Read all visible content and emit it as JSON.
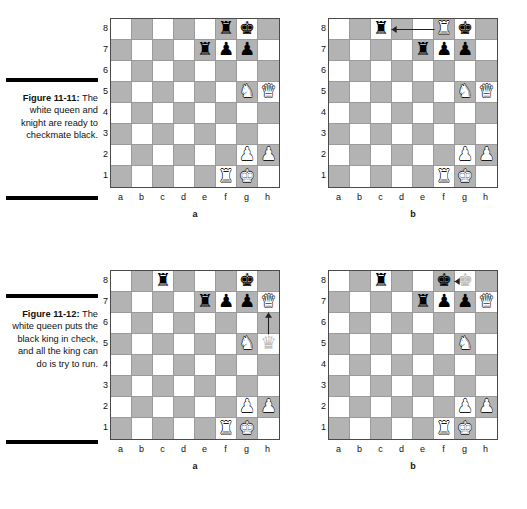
{
  "page": {
    "width": 527,
    "height": 509,
    "light_square_color": "#ffffff",
    "dark_square_color": "#b3b3b3",
    "ghost_piece_color": "#bdbdbd"
  },
  "figures": [
    {
      "id": "figure-11-11",
      "label": "Figure 11-11:",
      "caption": "The white queen and knight are ready to checkmate black.",
      "boards": [
        {
          "letter": "a",
          "rank_labels": [
            "8",
            "7",
            "6",
            "5",
            "4",
            "3",
            "2",
            "1"
          ],
          "file_labels": [
            "a",
            "b",
            "c",
            "d",
            "e",
            "f",
            "g",
            "h"
          ],
          "pieces": [
            {
              "square": "f8",
              "piece": "black-rook",
              "glyph": "♜",
              "color": "black"
            },
            {
              "square": "g8",
              "piece": "black-king",
              "glyph": "♚",
              "color": "black"
            },
            {
              "square": "e7",
              "piece": "black-rook",
              "glyph": "♜",
              "color": "black"
            },
            {
              "square": "f7",
              "piece": "black-pawn",
              "glyph": "♟",
              "color": "black"
            },
            {
              "square": "g7",
              "piece": "black-pawn",
              "glyph": "♟",
              "color": "black"
            },
            {
              "square": "g5",
              "piece": "white-knight",
              "glyph": "♞",
              "color": "white"
            },
            {
              "square": "h5",
              "piece": "white-queen",
              "glyph": "♛",
              "color": "white"
            },
            {
              "square": "g2",
              "piece": "white-pawn",
              "glyph": "♟",
              "color": "white"
            },
            {
              "square": "h2",
              "piece": "white-pawn",
              "glyph": "♟",
              "color": "white"
            },
            {
              "square": "f1",
              "piece": "white-rook",
              "glyph": "♜",
              "color": "white"
            },
            {
              "square": "g1",
              "piece": "white-king",
              "glyph": "♚",
              "color": "white"
            }
          ],
          "arrows": []
        },
        {
          "letter": "b",
          "rank_labels": [
            "8",
            "7",
            "6",
            "5",
            "4",
            "3",
            "2",
            "1"
          ],
          "file_labels": [
            "a",
            "b",
            "c",
            "d",
            "e",
            "f",
            "g",
            "h"
          ],
          "pieces": [
            {
              "square": "c8",
              "piece": "black-rook",
              "glyph": "♜",
              "color": "black"
            },
            {
              "square": "f8",
              "piece": "white-rook",
              "glyph": "♜",
              "color": "white"
            },
            {
              "square": "g8",
              "piece": "black-king",
              "glyph": "♚",
              "color": "black"
            },
            {
              "square": "e7",
              "piece": "black-rook",
              "glyph": "♜",
              "color": "black"
            },
            {
              "square": "f7",
              "piece": "black-pawn",
              "glyph": "♟",
              "color": "black"
            },
            {
              "square": "g7",
              "piece": "black-pawn",
              "glyph": "♟",
              "color": "black"
            },
            {
              "square": "g5",
              "piece": "white-knight",
              "glyph": "♞",
              "color": "white"
            },
            {
              "square": "h5",
              "piece": "white-queen",
              "glyph": "♛",
              "color": "white"
            },
            {
              "square": "g2",
              "piece": "white-pawn",
              "glyph": "♟",
              "color": "white"
            },
            {
              "square": "h2",
              "piece": "white-pawn",
              "glyph": "♟",
              "color": "white"
            },
            {
              "square": "f1",
              "piece": "white-rook",
              "glyph": "♜",
              "color": "white"
            },
            {
              "square": "g1",
              "piece": "white-king",
              "glyph": "♚",
              "color": "white"
            }
          ],
          "arrows": [
            {
              "from": "f8",
              "to": "c8",
              "direction": "left",
              "label": "rook-capture-arrow"
            }
          ]
        }
      ]
    },
    {
      "id": "figure-11-12",
      "label": "Figure 11-12:",
      "caption": "The white queen puts the black king in check, and all the king can do is try to run.",
      "boards": [
        {
          "letter": "a",
          "rank_labels": [
            "8",
            "7",
            "6",
            "5",
            "4",
            "3",
            "2",
            "1"
          ],
          "file_labels": [
            "a",
            "b",
            "c",
            "d",
            "e",
            "f",
            "g",
            "h"
          ],
          "pieces": [
            {
              "square": "c8",
              "piece": "black-rook",
              "glyph": "♜",
              "color": "black"
            },
            {
              "square": "g8",
              "piece": "black-king",
              "glyph": "♚",
              "color": "black"
            },
            {
              "square": "e7",
              "piece": "black-rook",
              "glyph": "♜",
              "color": "black"
            },
            {
              "square": "f7",
              "piece": "black-pawn",
              "glyph": "♟",
              "color": "black"
            },
            {
              "square": "g7",
              "piece": "black-pawn",
              "glyph": "♟",
              "color": "black"
            },
            {
              "square": "h7",
              "piece": "white-queen",
              "glyph": "♛",
              "color": "white"
            },
            {
              "square": "g5",
              "piece": "white-knight",
              "glyph": "♞",
              "color": "white"
            },
            {
              "square": "h5",
              "piece": "white-queen-ghost",
              "glyph": "♛",
              "color": "ghost"
            },
            {
              "square": "g2",
              "piece": "white-pawn",
              "glyph": "♟",
              "color": "white"
            },
            {
              "square": "h2",
              "piece": "white-pawn",
              "glyph": "♟",
              "color": "white"
            },
            {
              "square": "f1",
              "piece": "white-rook",
              "glyph": "♜",
              "color": "white"
            },
            {
              "square": "g1",
              "piece": "white-king",
              "glyph": "♚",
              "color": "white"
            }
          ],
          "arrows": [
            {
              "from": "h5",
              "to": "h7",
              "direction": "up",
              "label": "queen-move-arrow"
            }
          ]
        },
        {
          "letter": "b",
          "rank_labels": [
            "8",
            "7",
            "6",
            "5",
            "4",
            "3",
            "2",
            "1"
          ],
          "file_labels": [
            "a",
            "b",
            "c",
            "d",
            "e",
            "f",
            "g",
            "h"
          ],
          "pieces": [
            {
              "square": "c8",
              "piece": "black-rook",
              "glyph": "♜",
              "color": "black"
            },
            {
              "square": "f8",
              "piece": "black-king",
              "glyph": "♚",
              "color": "black"
            },
            {
              "square": "g8",
              "piece": "black-king-ghost",
              "glyph": "♚",
              "color": "ghost"
            },
            {
              "square": "e7",
              "piece": "black-rook",
              "glyph": "♜",
              "color": "black"
            },
            {
              "square": "f7",
              "piece": "black-pawn",
              "glyph": "♟",
              "color": "black"
            },
            {
              "square": "g7",
              "piece": "black-pawn",
              "glyph": "♟",
              "color": "black"
            },
            {
              "square": "h7",
              "piece": "white-queen",
              "glyph": "♛",
              "color": "white"
            },
            {
              "square": "g5",
              "piece": "white-knight",
              "glyph": "♞",
              "color": "white"
            },
            {
              "square": "g2",
              "piece": "white-pawn",
              "glyph": "♟",
              "color": "white"
            },
            {
              "square": "h2",
              "piece": "white-pawn",
              "glyph": "♟",
              "color": "white"
            },
            {
              "square": "f1",
              "piece": "white-rook",
              "glyph": "♜",
              "color": "white"
            },
            {
              "square": "g1",
              "piece": "white-king",
              "glyph": "♚",
              "color": "white"
            }
          ],
          "arrows": [
            {
              "from": "g8",
              "to": "f8",
              "direction": "left",
              "label": "king-move-arrow"
            }
          ]
        }
      ]
    }
  ]
}
